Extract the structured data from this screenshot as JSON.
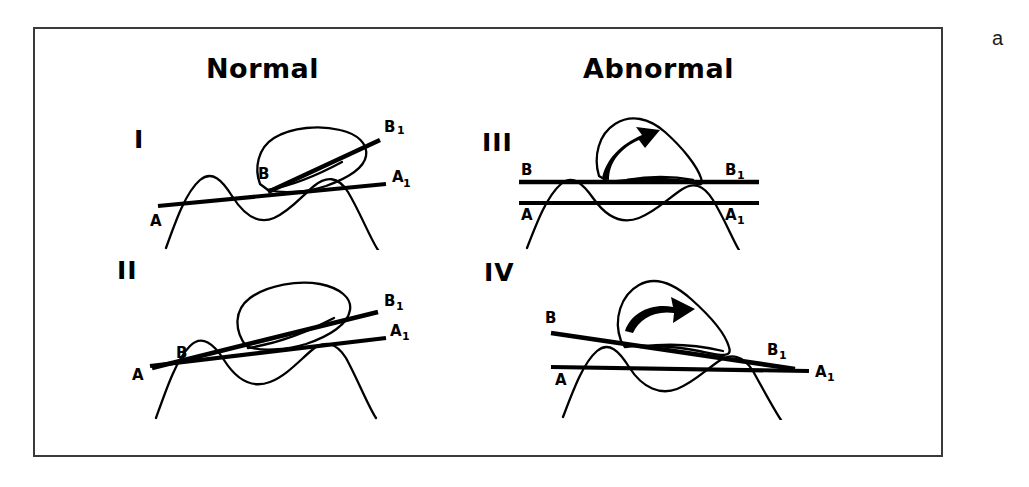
{
  "figure": {
    "part_label": "a",
    "frame": {
      "border_color": "#3a3a3a",
      "background": "#ffffff"
    },
    "ink_color": "#000000"
  },
  "headings": {
    "left": "Normal",
    "right": "Abnormal"
  },
  "panels": [
    {
      "numeral": "I",
      "group": "Normal",
      "labels": {
        "a_start": "A",
        "a_end": "A",
        "a_end_sub": "1",
        "b_start": "B",
        "b_end": "B",
        "b_end_sub": "1"
      },
      "has_arrow": false
    },
    {
      "numeral": "II",
      "group": "Normal",
      "labels": {
        "a_start": "A",
        "a_end": "A",
        "a_end_sub": "1",
        "b_start": "B",
        "b_end": "B",
        "b_end_sub": "1"
      },
      "has_arrow": false
    },
    {
      "numeral": "III",
      "group": "Abnormal",
      "labels": {
        "a_start": "A",
        "a_end": "A",
        "a_end_sub": "1",
        "b_start": "B",
        "b_end": "B",
        "b_end_sub": "1"
      },
      "has_arrow": true
    },
    {
      "numeral": "IV",
      "group": "Abnormal",
      "labels": {
        "a_start": "A",
        "a_end": "A",
        "a_end_sub": "1",
        "b_start": "B",
        "b_end": "B",
        "b_end_sub": "1"
      },
      "has_arrow": true
    }
  ]
}
